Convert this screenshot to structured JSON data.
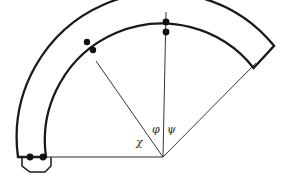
{
  "figure": {
    "type": "geometry-diagram",
    "background_color": "#ffffff",
    "stroke_color": "#1a1a1a",
    "thin_stroke_color": "#2b2b2b",
    "dot_color": "#111111"
  },
  "geometry": {
    "center": {
      "x": 163,
      "y": 157
    },
    "outer_radius": 145,
    "inner_radius": 117,
    "start_angle_deg": 180,
    "end_angle_deg": 40,
    "band_thickness": 28
  },
  "labels": {
    "chi": "χ",
    "phi": "φ",
    "psi": "ψ"
  },
  "label_positions": {
    "chi": {
      "x": 136,
      "y": 146
    },
    "phi": {
      "x": 153,
      "y": 133
    },
    "psi": {
      "x": 168,
      "y": 133
    }
  },
  "radial_lines": [
    {
      "name": "radial-line-chi",
      "angle_deg": 125,
      "from_center": true,
      "to_radius": 117
    },
    {
      "name": "radial-line-phi",
      "angle_deg": 90,
      "from_center": true,
      "to_radius": 145
    },
    {
      "name": "radial-line-psi",
      "angle_deg": 40,
      "from_center": true,
      "to_radius": 145
    },
    {
      "name": "baseline-radial",
      "angle_deg": 180,
      "from_center": true,
      "to_radius": 141
    }
  ],
  "marker_dots": [
    {
      "name": "dot-phi-outer",
      "x": 166,
      "y": 22,
      "r": 3.4
    },
    {
      "name": "dot-phi-inner",
      "x": 166,
      "y": 32,
      "r": 3.4
    },
    {
      "name": "dot-chi-outer",
      "x": 87,
      "y": 42,
      "r": 3.2
    },
    {
      "name": "dot-chi-inner",
      "x": 93,
      "y": 50,
      "r": 3.2
    },
    {
      "name": "dot-base-left",
      "x": 30,
      "y": 157,
      "r": 3.4
    },
    {
      "name": "dot-base-right",
      "x": 43,
      "y": 157,
      "r": 3.4
    }
  ],
  "notch": {
    "name": "bottom-left-notch",
    "points": "22,157 22,166 30,172 45,172 51,166 51,157"
  }
}
